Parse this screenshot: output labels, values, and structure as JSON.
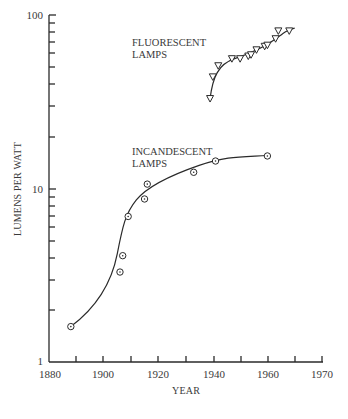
{
  "chart_data": {
    "type": "scatter",
    "title": "",
    "xlabel": "YEAR",
    "ylabel": "LUMENS PER WATT",
    "yscale": "log",
    "ylim": [
      1,
      100
    ],
    "xlim": [
      1880,
      1970
    ],
    "x_tick_labels": [
      "1880",
      "1900",
      "1920",
      "1940",
      "1960",
      "1970"
    ],
    "y_tick_labels": [
      "1",
      "10",
      "100"
    ],
    "grid": false,
    "legend": "none (series labeled inline)",
    "series": [
      {
        "name": "FLUORESCENT LAMPS",
        "label_lines": [
          "FLUORESCENT",
          "LAMPS"
        ],
        "marker": "triangle-down",
        "x": [
          1939,
          1940,
          1942,
          1947,
          1950,
          1953,
          1954,
          1956,
          1959,
          1960,
          1963,
          1964,
          1968
        ],
        "y": [
          33,
          44,
          51,
          56,
          56,
          58,
          59,
          63,
          66,
          67,
          73,
          81,
          81
        ],
        "fit_curve": true
      },
      {
        "name": "INCANDESCENT LAMPS",
        "label_lines": [
          "INCANDESCENT",
          "LAMPS"
        ],
        "marker": "circle-dot",
        "x": [
          1888,
          1906,
          1907,
          1909,
          1915,
          1916,
          1933,
          1941,
          1960
        ],
        "y": [
          1.6,
          3.3,
          4.1,
          6.9,
          8.7,
          10.6,
          12.4,
          14.4,
          15.4
        ],
        "fit_curve": true
      }
    ]
  }
}
